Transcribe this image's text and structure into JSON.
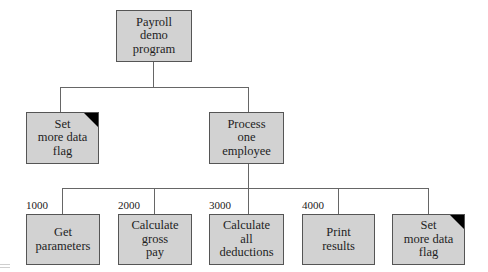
{
  "diagram": {
    "type": "structure-chart",
    "root": {
      "label": "Payroll\ndemo\nprogram"
    },
    "level2": [
      {
        "label": "Set\nmore data\nflag",
        "flag_marker": true
      },
      {
        "label": "Process\none\nemployee",
        "flag_marker": false
      }
    ],
    "level3": [
      {
        "number": "1000",
        "label": "Get\nparameters",
        "flag_marker": false
      },
      {
        "number": "2000",
        "label": "Calculate\ngross\npay",
        "flag_marker": false
      },
      {
        "number": "3000",
        "label": "Calculate\nall\ndeductions",
        "flag_marker": false
      },
      {
        "number": "4000",
        "label": "Print\nresults",
        "flag_marker": false
      },
      {
        "number": "",
        "label": "Set\nmore data\nflag",
        "flag_marker": true
      }
    ],
    "edges": [
      [
        "Payroll demo program",
        "Set more data flag"
      ],
      [
        "Payroll demo program",
        "Process one employee"
      ],
      [
        "Process one employee",
        "Get parameters"
      ],
      [
        "Process one employee",
        "Calculate gross pay"
      ],
      [
        "Process one employee",
        "Calculate all deductions"
      ],
      [
        "Process one employee",
        "Print results"
      ],
      [
        "Process one employee",
        "Set more data flag"
      ]
    ],
    "colors": {
      "box_fill": "#d2d2d2",
      "border": "#555555",
      "flag_corner": "#000000"
    }
  }
}
